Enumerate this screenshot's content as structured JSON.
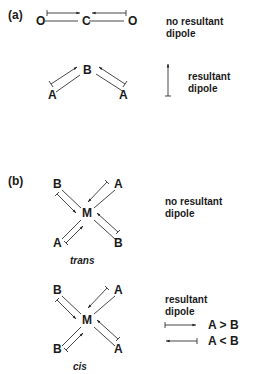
{
  "figure": {
    "colors": {
      "ink": "#1a1a1a",
      "background": "#ffffff"
    },
    "part_a": {
      "label": "(a)",
      "linear_molecule": {
        "atoms": [
          {
            "symbol": "O",
            "x": 35,
            "y": 15
          },
          {
            "symbol": "C",
            "x": 82,
            "y": 15
          },
          {
            "symbol": "O",
            "x": 129,
            "y": 15
          }
        ],
        "dipole_arrows": [
          "O→C",
          "O→C"
        ],
        "note_line1": "no resultant",
        "note_line2": "dipole"
      },
      "bent_molecule": {
        "atoms": [
          {
            "symbol": "B",
            "x": 84,
            "y": 68
          },
          {
            "symbol": "A",
            "x": 50,
            "y": 95
          },
          {
            "symbol": "A",
            "x": 120,
            "y": 95
          }
        ],
        "dipole_arrows": [
          "A→B",
          "A→B"
        ],
        "resultant_arrow": "up",
        "note_line1": "resultant",
        "note_line2": "dipole"
      }
    },
    "part_b": {
      "label": "(b)",
      "trans": {
        "caption": "trans",
        "center": "M",
        "ligands": {
          "top_left": "B",
          "top_right": "A",
          "bottom_left": "A",
          "bottom_right": "B"
        },
        "note_line1": "no resultant",
        "note_line2": "dipole"
      },
      "cis": {
        "caption": "cis",
        "center": "M",
        "ligands": {
          "top_left": "B",
          "top_right": "A",
          "bottom_left": "B",
          "bottom_right": "A"
        },
        "note_line1": "resultant",
        "note_line2": "dipole",
        "key": [
          {
            "arrow": "right",
            "text": "A > B"
          },
          {
            "arrow": "left",
            "text": "A < B"
          }
        ]
      }
    }
  }
}
